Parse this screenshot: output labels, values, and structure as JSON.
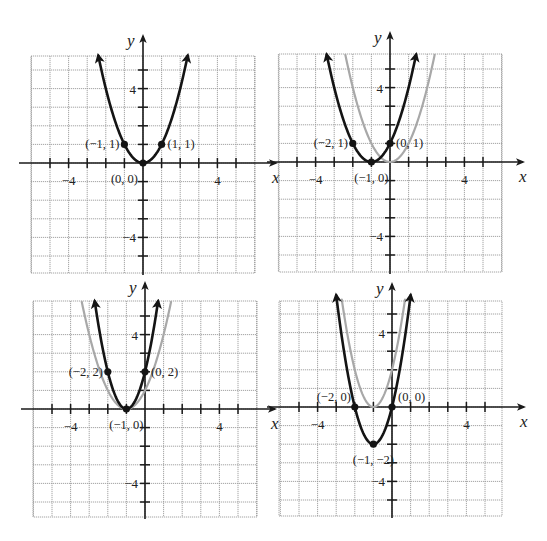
{
  "colors": {
    "background": "#ffffff",
    "grid": "#9a9a9a",
    "axis": "#1a1a1a",
    "primary_curve": "#141414",
    "reference_curve": "#a8a8a8",
    "point": "#141414",
    "text": "#222222"
  },
  "chart_data": [
    {
      "type": "line",
      "panel": "top-left",
      "title": "",
      "xlabel": "x",
      "ylabel": "y",
      "xlim": [
        -6,
        6
      ],
      "ylim": [
        -6,
        6
      ],
      "grid": true,
      "x_ticks_labeled": [
        -4,
        4
      ],
      "y_ticks_labeled": [
        4,
        -4
      ],
      "series": [
        {
          "name": "y = x^2",
          "role": "primary",
          "equation": "y = x^2",
          "a": 1,
          "h": 0,
          "k": 0,
          "x_range": [
            -2.4,
            2.4
          ],
          "arrows": true
        }
      ],
      "points": [
        {
          "x": -1,
          "y": 1,
          "label": "(−1, 1)",
          "anchor": "left"
        },
        {
          "x": 0,
          "y": 0,
          "label": "(0, 0)",
          "anchor": "below-left"
        },
        {
          "x": 1,
          "y": 1,
          "label": "(1, 1)",
          "anchor": "right"
        }
      ]
    },
    {
      "type": "line",
      "panel": "top-right",
      "title": "",
      "xlabel": "x",
      "ylabel": "y",
      "xlim": [
        -6,
        6
      ],
      "ylim": [
        -6,
        6
      ],
      "grid": true,
      "x_ticks_labeled": [
        -4,
        4
      ],
      "y_ticks_labeled": [
        4,
        -4
      ],
      "series": [
        {
          "name": "y = x^2",
          "role": "reference",
          "equation": "y = x^2",
          "a": 1,
          "h": 0,
          "k": 0,
          "x_range": [
            -2.4,
            2.4
          ],
          "arrows": false
        },
        {
          "name": "y = (x+1)^2",
          "role": "primary",
          "equation": "y = (x + 1)^2",
          "a": 1,
          "h": -1,
          "k": 0,
          "x_range": [
            -3.4,
            1.4
          ],
          "arrows": true
        }
      ],
      "points": [
        {
          "x": -2,
          "y": 1,
          "label": "(−2, 1)",
          "anchor": "left"
        },
        {
          "x": -1,
          "y": 0,
          "label": "(−1, 0)",
          "anchor": "below"
        },
        {
          "x": 0,
          "y": 1,
          "label": "(0, 1)",
          "anchor": "right"
        }
      ]
    },
    {
      "type": "line",
      "panel": "bottom-left",
      "title": "",
      "xlabel": "x",
      "ylabel": "y",
      "xlim": [
        -6,
        6
      ],
      "ylim": [
        -6,
        6
      ],
      "grid": true,
      "x_ticks_labeled": [
        -4,
        4
      ],
      "y_ticks_labeled": [
        4,
        -4
      ],
      "series": [
        {
          "name": "y = (x+1)^2",
          "role": "reference",
          "equation": "y = (x + 1)^2",
          "a": 1,
          "h": -1,
          "k": 0,
          "x_range": [
            -3.4,
            1.4
          ],
          "arrows": false
        },
        {
          "name": "y = 2(x+1)^2",
          "role": "primary",
          "equation": "y = 2(x + 1)^2",
          "a": 2,
          "h": -1,
          "k": 0,
          "x_range": [
            -2.7,
            0.7
          ],
          "arrows": true
        }
      ],
      "points": [
        {
          "x": -2,
          "y": 2,
          "label": "(−2, 2)",
          "anchor": "left"
        },
        {
          "x": -1,
          "y": 0,
          "label": "(−1, 0)",
          "anchor": "below"
        },
        {
          "x": 0,
          "y": 2,
          "label": "(0, 2)",
          "anchor": "right"
        }
      ]
    },
    {
      "type": "line",
      "panel": "bottom-right",
      "title": "",
      "xlabel": "x",
      "ylabel": "y",
      "xlim": [
        -6,
        6
      ],
      "ylim": [
        -6,
        6
      ],
      "grid": true,
      "x_ticks_labeled": [
        -4,
        4
      ],
      "y_ticks_labeled": [
        4,
        -4
      ],
      "series": [
        {
          "name": "y = 2(x+1)^2",
          "role": "reference",
          "equation": "y = 2(x + 1)^2",
          "a": 2,
          "h": -1,
          "k": 0,
          "x_range": [
            -2.7,
            0.7
          ],
          "arrows": false
        },
        {
          "name": "y = 2(x+1)^2 - 2",
          "role": "primary",
          "equation": "y = 2(x + 1)^2 − 2",
          "a": 2,
          "h": -1,
          "k": -2,
          "x_range": [
            -3.0,
            1.0
          ],
          "arrows": true
        }
      ],
      "points": [
        {
          "x": -2,
          "y": 0,
          "label": "(−2, 0)",
          "anchor": "above-left"
        },
        {
          "x": -1,
          "y": -2,
          "label": "(−1, −2)",
          "anchor": "below"
        },
        {
          "x": 0,
          "y": 0,
          "label": "(0, 0)",
          "anchor": "above-right"
        }
      ]
    }
  ],
  "layout": {
    "panels": [
      {
        "id": "top-left",
        "ox": 143,
        "oy": 163,
        "left": 31,
        "right": 255,
        "top": 56,
        "bottom": 273,
        "arrow_y_top": 36,
        "arrow_x_right": 276
      },
      {
        "id": "top-right",
        "ox": 390,
        "oy": 162,
        "left": 279,
        "right": 502,
        "top": 54,
        "bottom": 272,
        "arrow_y_top": 33,
        "arrow_x_right": 523
      },
      {
        "id": "bottom-left",
        "ox": 145,
        "oy": 409,
        "left": 33,
        "right": 257,
        "top": 301,
        "bottom": 517,
        "arrow_y_top": 283,
        "arrow_x_right": 275
      },
      {
        "id": "bottom-right",
        "ox": 392,
        "oy": 407,
        "left": 279,
        "right": 502,
        "top": 301,
        "bottom": 516,
        "arrow_y_top": 284,
        "arrow_x_right": 524
      }
    ],
    "unit_px": 18.6
  }
}
